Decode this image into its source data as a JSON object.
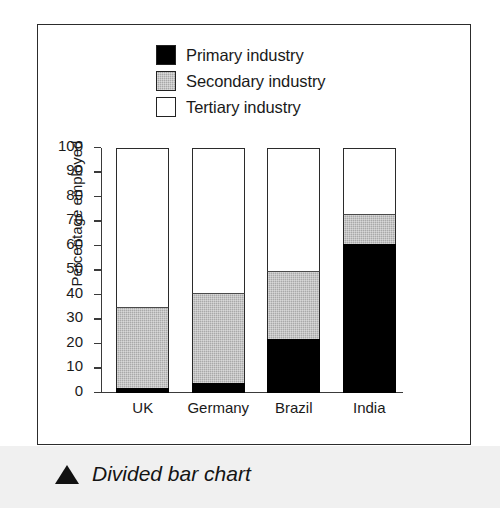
{
  "caption": {
    "marker": "triangle-up-icon",
    "text": "Divided bar chart"
  },
  "chart_data": {
    "type": "bar",
    "subtype": "stacked-percentage",
    "title": "",
    "xlabel": "",
    "ylabel": "Percentage employed",
    "ylim": [
      0,
      100
    ],
    "ytick_step": 10,
    "yticks": [
      100,
      90,
      80,
      70,
      60,
      50,
      40,
      30,
      20,
      10,
      0
    ],
    "grid": false,
    "legend_position": "top-center",
    "categories": [
      "UK",
      "Germany",
      "Brazil",
      "India"
    ],
    "series": [
      {
        "name": "Primary industry",
        "color": "#000000",
        "values": [
          2,
          4,
          22,
          61
        ]
      },
      {
        "name": "Secondary industry",
        "color": "#a9a9a9",
        "values": [
          33,
          37,
          28,
          12
        ]
      },
      {
        "name": "Tertiary industry",
        "color": "#ffffff",
        "values": [
          65,
          59,
          50,
          27
        ]
      }
    ],
    "cumulative_tops": {
      "primary": [
        2,
        4,
        22,
        61
      ],
      "secondary": [
        35,
        41,
        50,
        73
      ],
      "tertiary": [
        100,
        100,
        100,
        100
      ]
    }
  },
  "legend": {
    "items": [
      {
        "label": "Primary industry",
        "swatch": "primary"
      },
      {
        "label": "Secondary industry",
        "swatch": "secondary"
      },
      {
        "label": "Tertiary industry",
        "swatch": "tertiary"
      }
    ]
  }
}
